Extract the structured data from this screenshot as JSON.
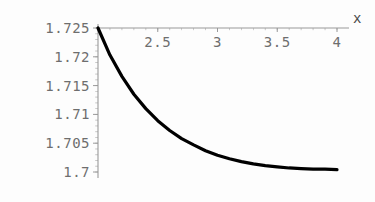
{
  "chart_data": {
    "type": "line",
    "title": "",
    "subtitle": "",
    "xlabel": "x",
    "ylabel": "",
    "xlim": [
      2,
      4
    ],
    "ylim": [
      1.7,
      1.725
    ],
    "grid": false,
    "legend": null,
    "x_ticks": [
      {
        "value": 2.5,
        "label": "2.5"
      },
      {
        "value": 3,
        "label": "3"
      },
      {
        "value": 3.5,
        "label": "3.5"
      },
      {
        "value": 4,
        "label": "4"
      }
    ],
    "y_ticks": [
      {
        "value": 1.725,
        "label": "1.725"
      },
      {
        "value": 1.72,
        "label": "1.72"
      },
      {
        "value": 1.715,
        "label": "1.715"
      },
      {
        "value": 1.71,
        "label": "1.71"
      },
      {
        "value": 1.705,
        "label": "1.705"
      },
      {
        "value": 1.7,
        "label": "1.7"
      }
    ],
    "x": [
      2.0,
      2.1,
      2.2,
      2.3,
      2.4,
      2.5,
      2.6,
      2.7,
      2.8,
      2.9,
      3.0,
      3.1,
      3.2,
      3.3,
      3.4,
      3.5,
      3.6,
      3.7,
      3.8,
      3.9,
      4.0
    ],
    "series": [
      {
        "name": "curve",
        "color": "#000000",
        "values": [
          1.725,
          1.7203,
          1.7166,
          1.7135,
          1.711,
          1.7089,
          1.7072,
          1.7058,
          1.7047,
          1.7037,
          1.7029,
          1.7023,
          1.7018,
          1.7014,
          1.7011,
          1.7009,
          1.7007,
          1.7006,
          1.7005,
          1.7005,
          1.7004
        ]
      }
    ],
    "colors": {
      "background": "#fdfdfd",
      "axis": "#9a9a9a",
      "tick_text": "#6e6e6e",
      "curve": "#000000"
    }
  }
}
